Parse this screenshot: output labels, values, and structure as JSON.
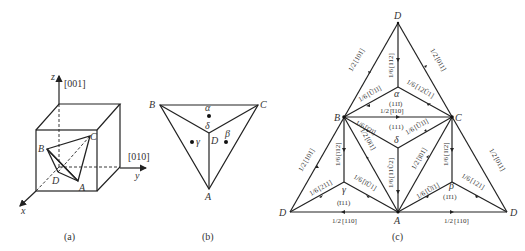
{
  "panel_a": {
    "caption": "(a)",
    "axes": {
      "z": "z",
      "z_dir": "[001]",
      "y": "y",
      "y_dir": "[010]",
      "x": "x"
    },
    "vertices": {
      "A": "A",
      "B": "B",
      "C": "C",
      "D": "D"
    }
  },
  "panel_b": {
    "caption": "(b)",
    "vertices": {
      "A": "A",
      "B": "B",
      "C": "C",
      "D": "D"
    },
    "faces": {
      "alpha": "α",
      "beta": "β",
      "gamma": "γ",
      "delta": "δ"
    }
  },
  "panel_c": {
    "caption": "(c)",
    "vertices": {
      "D_top": "D",
      "B": "B",
      "C": "C",
      "A": "A",
      "D_left": "D",
      "D_right": "D"
    },
    "centers": {
      "alpha": {
        "symbol": "α",
        "plane": "(11̅\u00031)"
      },
      "delta": {
        "symbol": "δ",
        "plane": "(111)"
      },
      "gamma": {
        "symbol": "γ",
        "plane": "(1̅ 11)"
      },
      "beta": {
        "symbol": "β",
        "plane": "(1 1̅ 1)"
      }
    },
    "planes": {
      "alpha": "(11ī)",
      "delta": "(111)",
      "gamma": "(ī11)",
      "beta": "(1ī1)"
    },
    "edge_labels": {
      "DB_top": {
        "frac": "1/2",
        "dir": "[101]"
      },
      "DC_top": {
        "frac": "1/2",
        "dir": "[011]"
      },
      "D_alpha": {
        "frac": "1/6",
        "dir": "[112]"
      },
      "B_alpha": {
        "frac": "1/6",
        "dir": "[Ũ1ī]"
      },
      "C_alpha": {
        "frac": "1/6",
        "dir": "[12Ũ1]"
      },
      "BC": {
        "frac": "1/2",
        "dir": "[ī10]"
      },
      "B_delta": {
        "frac": "1/6",
        "dir": "[ī2ī]"
      },
      "C_delta": {
        "frac": "1/6",
        "dir": "[Ũ1ī]"
      },
      "BA": {
        "frac": "1/2",
        "dir": "[0ī1]"
      },
      "CA": {
        "frac": "1/2",
        "dir": "[ī01]"
      },
      "delta_A": {
        "frac": "1/6",
        "dir": "[11Ũ2]"
      },
      "B_gamma": {
        "frac": "1/6",
        "dir": "[ī12]"
      },
      "C_beta": {
        "frac": "1/6",
        "dir": "[1ī2]"
      },
      "DB_left": {
        "frac": "1/2",
        "dir": "[101]"
      },
      "DC_right": {
        "frac": "1/2",
        "dir": "[011]"
      },
      "D_gamma": {
        "frac": "1/6",
        "dir": "[211]"
      },
      "A_gamma": {
        "frac": "1/6",
        "dir": "[īŨ1]"
      },
      "A_beta": {
        "frac": "1/6",
        "dir": "[Ũī1]"
      },
      "D_beta": {
        "frac": "1/6",
        "dir": "[121]"
      },
      "DA_left": {
        "frac": "1/2",
        "dir": "[110]"
      },
      "DA_right": {
        "frac": "1/2",
        "dir": "[110]"
      }
    }
  }
}
